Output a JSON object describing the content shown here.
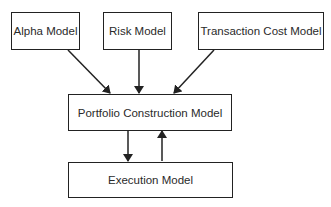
{
  "diagram": {
    "type": "flowchart",
    "nodes": [
      {
        "id": "alpha",
        "label": "Alpha Model"
      },
      {
        "id": "risk",
        "label": "Risk Model"
      },
      {
        "id": "tcost",
        "label": "Transaction Cost Model"
      },
      {
        "id": "portfolio",
        "label": "Portfolio Construction Model"
      },
      {
        "id": "execution",
        "label": "Execution Model"
      }
    ],
    "edges": [
      {
        "from": "alpha",
        "to": "portfolio"
      },
      {
        "from": "risk",
        "to": "portfolio"
      },
      {
        "from": "tcost",
        "to": "portfolio"
      },
      {
        "from": "portfolio",
        "to": "execution"
      },
      {
        "from": "execution",
        "to": "portfolio"
      }
    ],
    "colors": {
      "line": "#222222",
      "text": "#2a2a2a",
      "background": "#ffffff"
    }
  }
}
